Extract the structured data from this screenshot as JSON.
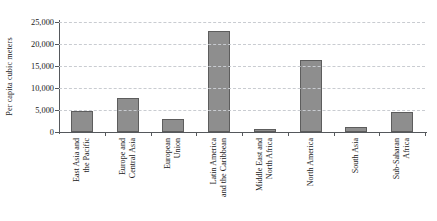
{
  "chart_data": {
    "type": "bar",
    "title": "",
    "xlabel": "",
    "ylabel": "Per capita cubic meters",
    "ylim": [
      0,
      25000
    ],
    "ytick_labels": [
      "0",
      "5,000",
      "10,000",
      "15,000",
      "20,000",
      "25,000"
    ],
    "ytick_values": [
      0,
      5000,
      10000,
      15000,
      20000,
      25000
    ],
    "grid": true,
    "legend": "none",
    "categories": [
      "East Asia and the Pacific",
      "Europe and Central Asia",
      "European Union",
      "Latin America and the Caribbean",
      "Middle East and North Africa",
      "North America",
      "South Asia",
      "Sub-Saharan Africa"
    ],
    "category_lines": [
      [
        "East Asia and",
        "the Pacific"
      ],
      [
        "Europe and",
        "Central Asia"
      ],
      [
        "European",
        "Union"
      ],
      [
        "Latin America",
        "and the Caribbean"
      ],
      [
        "Middle East and",
        "North Africa"
      ],
      [
        "North America",
        ""
      ],
      [
        "South Asia",
        ""
      ],
      [
        "Sub-Saharan",
        "Africa"
      ]
    ],
    "values": [
      4700,
      7800,
      2900,
      22900,
      600,
      16400,
      1200,
      4600
    ],
    "bar_color": "#8e8e8e",
    "bar_edge_color": "#5d5d5d",
    "grid_color": "#c9ccd1",
    "axis_color": "#55585c"
  }
}
